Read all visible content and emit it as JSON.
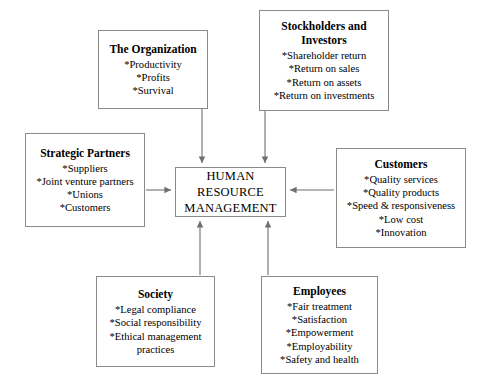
{
  "diagram": {
    "line_color": "#8a8a8a",
    "arrow_color": "#6f6f6f",
    "background": "#ffffff",
    "nodes": {
      "center": {
        "title": "HUMAN\nRESOURCE\nMANAGEMENT",
        "items": []
      },
      "organization": {
        "title": "The Organization",
        "items": [
          "*Productivity",
          "*Profits",
          "*Survival"
        ]
      },
      "stockholders": {
        "title": "Stockholders and\nInvestors",
        "items": [
          "*Shareholder return",
          "*Return on sales",
          "*Return on assets",
          "*Return on investments"
        ]
      },
      "strategic_partners": {
        "title": "Strategic Partners",
        "items": [
          "*Suppliers",
          "*Joint venture partners",
          "*Unions",
          "*Customers"
        ]
      },
      "customers": {
        "title": "Customers",
        "items": [
          "*Quality services",
          "*Quality products",
          "*Speed & responsiveness",
          "*Low cost",
          "*Innovation"
        ]
      },
      "society": {
        "title": "Society",
        "items": [
          "*Legal compliance",
          "*Social responsibility",
          "*Ethical management\npractices"
        ]
      },
      "employees": {
        "title": "Employees",
        "items": [
          "*Fair treatment",
          "*Satisfaction",
          "*Empowerment",
          "*Employability",
          "*Safety and health"
        ]
      }
    },
    "connectors": [
      {
        "from": "organization",
        "to": "center",
        "direction": "down"
      },
      {
        "from": "stockholders",
        "to": "center",
        "direction": "down"
      },
      {
        "from": "strategic_partners",
        "to": "center",
        "direction": "right"
      },
      {
        "from": "customers",
        "to": "center",
        "direction": "left"
      },
      {
        "from": "society",
        "to": "center",
        "direction": "up"
      },
      {
        "from": "employees",
        "to": "center",
        "direction": "up"
      }
    ]
  }
}
